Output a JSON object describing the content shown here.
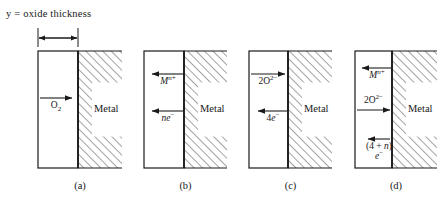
{
  "figure": {
    "title": "y = oxide thickness",
    "dimension_arrow": {
      "label": "y",
      "from_x": 38,
      "to_x": 78,
      "y": 38
    },
    "metal_label": "Metal",
    "stroke_color": "#1a1a1a",
    "hatch_color": "#4a4a4a",
    "background": "#ffffff"
  },
  "panels": [
    {
      "id": "a",
      "caption": "(a)",
      "oxide_left": 38,
      "interface_x": 78,
      "hatch_right": 122,
      "box_top": 51,
      "box_bottom": 168,
      "species": [
        {
          "name": "oxygen-gas",
          "text": "O2",
          "html": "O<sub>2</sub>",
          "direction": "right",
          "arrow_y": 98,
          "label_y": 101,
          "arrow_from": 40,
          "arrow_to": 72
        }
      ]
    },
    {
      "id": "b",
      "caption": "(b)",
      "oxide_left": 144,
      "interface_x": 184,
      "hatch_right": 227,
      "box_top": 51,
      "box_bottom": 168,
      "species": [
        {
          "name": "metal-cation",
          "text": "M n+",
          "html": "<span class=\"it\">M</span><sup><span class=\"it\">n</span>+</sup>",
          "direction": "left",
          "arrow_y": 74,
          "label_y": 77,
          "arrow_from": 184,
          "arrow_to": 152
        },
        {
          "name": "electrons",
          "text": "ne-",
          "html": "<span class=\"it\">ne</span><sup>−</sup>",
          "direction": "left",
          "arrow_y": 111,
          "label_y": 114,
          "arrow_from": 184,
          "arrow_to": 152
        }
      ]
    },
    {
      "id": "c",
      "caption": "(c)",
      "oxide_left": 249,
      "interface_x": 288,
      "hatch_right": 332,
      "box_top": 51,
      "box_bottom": 168,
      "species": [
        {
          "name": "oxide-anion",
          "text": "2O2-",
          "html": "2O<sup>2−</sup>",
          "direction": "right",
          "arrow_y": 74,
          "label_y": 77,
          "arrow_from": 251,
          "arrow_to": 285
        },
        {
          "name": "electrons",
          "text": "4e-",
          "html": "4<span class=\"it\">e</span><sup>−</sup>",
          "direction": "left",
          "arrow_y": 111,
          "label_y": 114,
          "arrow_from": 288,
          "arrow_to": 258
        }
      ]
    },
    {
      "id": "d",
      "caption": "(d)",
      "oxide_left": 355,
      "interface_x": 392,
      "hatch_right": 437,
      "box_top": 51,
      "box_bottom": 168,
      "species": [
        {
          "name": "metal-cation",
          "text": "M n+",
          "html": "<span class=\"it\">M</span><sup><span class=\"it\">n</span>+</sup>",
          "direction": "left",
          "arrow_y": 68,
          "label_y": 71,
          "arrow_from": 392,
          "arrow_to": 362
        },
        {
          "name": "oxide-anion",
          "text": "2O2-",
          "html": "2O<sup>2−</sup>",
          "direction": "right",
          "arrow_y": 110,
          "label_y": 96,
          "arrow_from": 357,
          "arrow_to": 390
        },
        {
          "name": "electrons",
          "text": "(4 + n) e-",
          "html": "(4&nbsp;+&nbsp;<span class=\"it\">n</span>)<br><span class=\"it\">e</span><sup>−</sup>",
          "direction": "left",
          "arrow_y": 139,
          "label_y": 142,
          "arrow_from": 390,
          "arrow_to": 368
        }
      ]
    }
  ]
}
